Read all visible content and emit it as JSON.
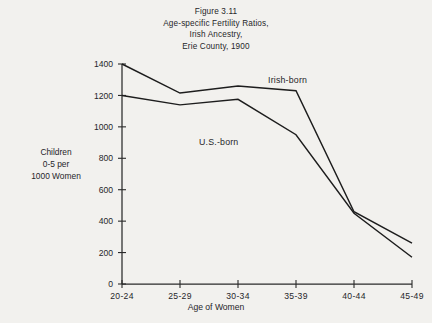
{
  "figure": {
    "title_lines": [
      "Figure 3.11",
      "Age-specific Fertility Ratios,",
      "Irish Ancestry,",
      "Erie County, 1900"
    ],
    "y_axis_title_lines": [
      "Children",
      "0-5 per",
      "1000 Women"
    ],
    "x_axis_title": "Age of Women"
  },
  "chart_data": {
    "type": "line",
    "title": "Figure 3.11 Age-specific Fertility Ratios, Irish Ancestry, Erie County, 1900",
    "xlabel": "Age of Women",
    "ylabel": "Children 0-5 per 1000 Women",
    "categories": [
      "20-24",
      "25-29",
      "30-34",
      "35-39",
      "40-44",
      "45-49"
    ],
    "series": [
      {
        "name": "Irish-born",
        "values": [
          1400,
          1215,
          1260,
          1230,
          460,
          260
        ],
        "color": "#1d1d1d"
      },
      {
        "name": "U.S.-born",
        "values": [
          1200,
          1140,
          1175,
          950,
          450,
          170
        ],
        "color": "#1d1d1d"
      }
    ],
    "ylim": [
      0,
      1400
    ],
    "yticks": [
      0,
      200,
      400,
      600,
      800,
      1000,
      1200,
      1400
    ],
    "ytick_labels": [
      "0",
      "200",
      "400",
      "600",
      "800",
      "1000",
      "1200",
      "1400"
    ],
    "grid": false,
    "legend": "inline-annotations",
    "annotations": [
      {
        "text": "Irish-born",
        "x_px": 268,
        "y_px": 83
      },
      {
        "text": "U.S.-born",
        "x_px": 199,
        "y_px": 145
      }
    ]
  },
  "colors": {
    "background": "#f2f1ee",
    "line": "#1d1d1d",
    "axis": "#2a2a2a",
    "text": "#26262a"
  }
}
